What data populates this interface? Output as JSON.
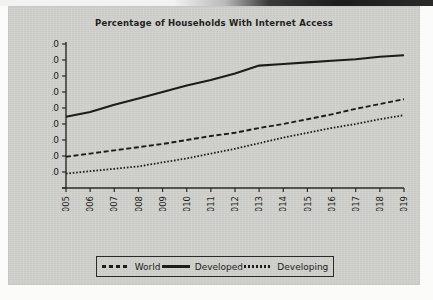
{
  "chart_data": {
    "type": "line",
    "title": "Percentage of Households With Internet Access",
    "xlabel": "",
    "ylabel": "",
    "x": [
      2005,
      2006,
      2007,
      2008,
      2009,
      2010,
      2011,
      2012,
      2013,
      2014,
      2015,
      2016,
      2017,
      2018,
      2019
    ],
    "categories": [
      "2005",
      "2006",
      "2007",
      "2008",
      "2009",
      "2010",
      "2011",
      "2012",
      "2013",
      "2014",
      "2015",
      "2016",
      "2017",
      "2018",
      "2019"
    ],
    "ylim": [
      0,
      90
    ],
    "yticks": [
      10,
      20,
      30,
      40,
      50,
      60,
      70,
      80,
      90
    ],
    "ytick_labels": [
      "10.0",
      "20.0",
      "30.0",
      "40.0",
      "50.0",
      "60.0",
      "70.0",
      "80.0",
      "90.0"
    ],
    "grid": false,
    "legend_position": "bottom",
    "series": [
      {
        "name": "World",
        "style": "dashed",
        "color": "#1c1c1b",
        "values": [
          19.5,
          21.5,
          23.5,
          25.5,
          27.5,
          30.0,
          32.5,
          34.5,
          37.5,
          40.0,
          43.0,
          46.0,
          49.5,
          52.5,
          55.5
        ]
      },
      {
        "name": "Developed",
        "style": "solid",
        "color": "#1c1c1b",
        "values": [
          44.5,
          47.5,
          52.0,
          56.0,
          60.0,
          64.0,
          67.5,
          71.5,
          76.5,
          77.5,
          78.5,
          79.5,
          80.5,
          82.0,
          83.0
        ]
      },
      {
        "name": "Developing",
        "style": "dotted",
        "color": "#1c1c1b",
        "values": [
          9.0,
          10.5,
          12.0,
          13.5,
          16.0,
          18.5,
          21.5,
          24.5,
          28.0,
          31.5,
          34.5,
          37.5,
          40.0,
          43.0,
          45.5
        ]
      }
    ]
  },
  "legend": {
    "items": [
      {
        "label": "World"
      },
      {
        "label": "Developed"
      },
      {
        "label": "Developing"
      }
    ]
  }
}
